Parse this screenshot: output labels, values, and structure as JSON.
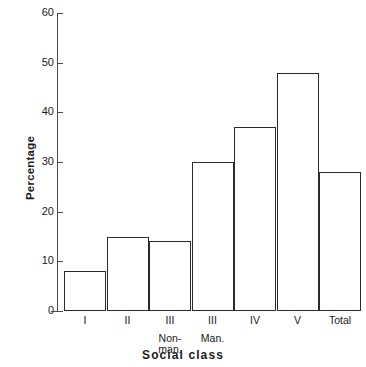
{
  "chart_data": {
    "type": "bar",
    "title": "",
    "xlabel": "Social class",
    "ylabel": "Percentage",
    "categories": [
      "I",
      "II",
      "III Non-man.",
      "III Man.",
      "IV",
      "V",
      "Total"
    ],
    "category_lines": [
      [
        "I",
        "",
        ""
      ],
      [
        "II",
        "",
        ""
      ],
      [
        "III",
        "Non-",
        "man."
      ],
      [
        "III",
        "Man.",
        ""
      ],
      [
        "IV",
        "",
        ""
      ],
      [
        "V",
        "",
        ""
      ],
      [
        "Total",
        "",
        ""
      ]
    ],
    "values": [
      8,
      15,
      14,
      30,
      37,
      48,
      28
    ],
    "ylim": [
      0,
      60
    ],
    "ytick_labels": [
      "0",
      "10",
      "20",
      "30",
      "40",
      "50",
      "60"
    ],
    "ytick_values": [
      0,
      10,
      20,
      30,
      40,
      50,
      60
    ],
    "grid": false,
    "legend": false,
    "bar_fill_color": "#ffffff",
    "bar_edge_color": "#2b2b2b",
    "axis_color": "#4a4a4a",
    "background_color": "#ffffff"
  }
}
